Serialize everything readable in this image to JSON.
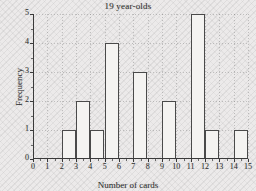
{
  "chart_data": {
    "type": "bar",
    "title": "19 year-olds",
    "xlabel": "Number of cards",
    "ylabel": "Frequency",
    "categories": [
      0,
      1,
      2,
      3,
      4,
      5,
      6,
      7,
      8,
      9,
      10,
      11,
      12,
      13,
      14,
      15
    ],
    "values": [
      0,
      0,
      1,
      2,
      1,
      4,
      0,
      3,
      0,
      2,
      0,
      5,
      1,
      0,
      1,
      0
    ],
    "bars": [
      {
        "x": 2,
        "height": 1
      },
      {
        "x": 3,
        "height": 2
      },
      {
        "x": 4,
        "height": 1
      },
      {
        "x": 5,
        "height": 4
      },
      {
        "x": 7,
        "height": 3
      },
      {
        "x": 9,
        "height": 2
      },
      {
        "x": 11,
        "height": 5
      },
      {
        "x": 12,
        "height": 1
      },
      {
        "x": 14,
        "height": 1
      }
    ],
    "xtick_labels": [
      "0",
      "1",
      "2",
      "3",
      "4",
      "5",
      "6",
      "7",
      "8",
      "9",
      "10",
      "11",
      "12",
      "13",
      "14",
      "15"
    ],
    "ytick_labels": [
      "0",
      "1",
      "2",
      "3",
      "4",
      "5"
    ],
    "xlim": [
      0,
      15
    ],
    "ylim": [
      0,
      5
    ],
    "grid": true,
    "legend": "none",
    "bar_width_units": 1,
    "colors": {
      "bar_fill": "#f4f3f1",
      "bar_edge": "#4a4a4a",
      "axis": "#3a3a3a",
      "grid": "#828282",
      "text": "#303030",
      "background": "#eceaea"
    }
  }
}
